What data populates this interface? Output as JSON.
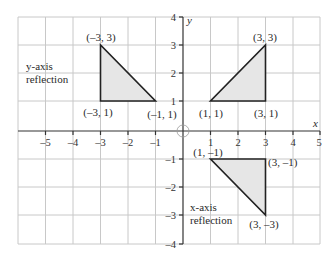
{
  "diagram": {
    "axes": {
      "x_label": "x",
      "y_label": "y",
      "x_range": [
        -6,
        5
      ],
      "y_range": [
        -4,
        4
      ],
      "x_ticks": [
        "–5",
        "–4",
        "–3",
        "–2",
        "–1",
        "1",
        "2",
        "3",
        "4",
        "5"
      ],
      "y_ticks": [
        "4",
        "3",
        "2",
        "1",
        "–1",
        "–2",
        "–3",
        "–4"
      ]
    },
    "triangles": [
      {
        "name": "original",
        "vertices": [
          [
            1,
            1
          ],
          [
            3,
            1
          ],
          [
            3,
            3
          ]
        ],
        "labels": [
          "(1, 1)",
          "(3, 1)",
          "(3, 3)"
        ]
      },
      {
        "name": "y-axis reflection",
        "vertices": [
          [
            -3,
            1
          ],
          [
            -1,
            1
          ],
          [
            -3,
            3
          ]
        ],
        "labels": [
          "(–3, 1)",
          "(–1, 1)",
          "(–3, 3)"
        ],
        "caption_line1": "y-axis",
        "caption_line2": "reflection"
      },
      {
        "name": "x-axis reflection",
        "vertices": [
          [
            1,
            -1
          ],
          [
            3,
            -1
          ],
          [
            3,
            -3
          ]
        ],
        "labels": [
          "(1, –1)",
          "(3, –1)",
          "(3, –3)"
        ],
        "caption_line1": "x-axis",
        "caption_line2": "reflection"
      }
    ],
    "colors": {
      "grid": "#c8c8c8",
      "axis": "#333333",
      "fill": "#e6e6e6",
      "edge": "#222222"
    }
  }
}
